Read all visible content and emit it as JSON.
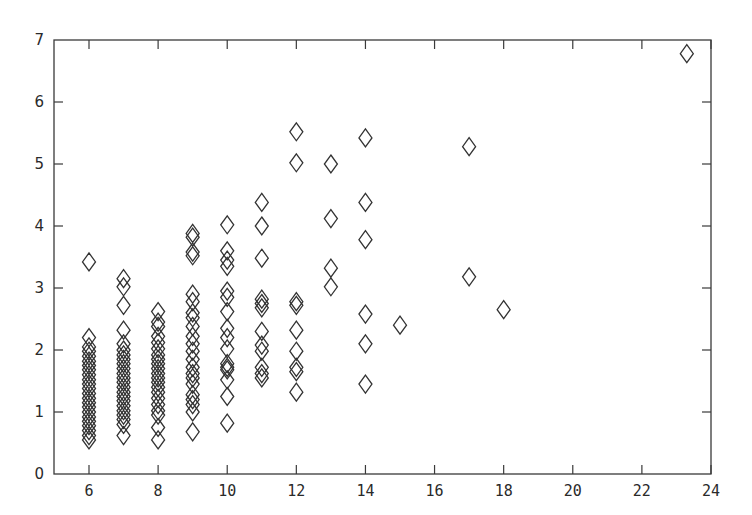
{
  "chart_data": {
    "type": "scatter",
    "title": "",
    "xlabel": "",
    "ylabel": "",
    "xlim": [
      5,
      24
    ],
    "ylim": [
      0,
      7
    ],
    "grid": false,
    "legend": null,
    "marker": "diamond-open",
    "x_ticks": [
      6,
      8,
      10,
      12,
      14,
      16,
      18,
      20,
      22,
      24
    ],
    "y_ticks": [
      0,
      1,
      2,
      3,
      4,
      5,
      6,
      7
    ],
    "series": [
      {
        "name": "points",
        "points": [
          [
            6,
            3.42
          ],
          [
            6,
            2.2
          ],
          [
            6,
            2.05
          ],
          [
            6,
            1.98
          ],
          [
            6,
            1.9
          ],
          [
            6,
            1.82
          ],
          [
            6,
            1.75
          ],
          [
            6,
            1.68
          ],
          [
            6,
            1.6
          ],
          [
            6,
            1.52
          ],
          [
            6,
            1.45
          ],
          [
            6,
            1.38
          ],
          [
            6,
            1.3
          ],
          [
            6,
            1.22
          ],
          [
            6,
            1.15
          ],
          [
            6,
            1.08
          ],
          [
            6,
            1.0
          ],
          [
            6,
            0.92
          ],
          [
            6,
            0.85
          ],
          [
            6,
            0.78
          ],
          [
            6,
            0.7
          ],
          [
            6,
            0.62
          ],
          [
            6,
            0.55
          ],
          [
            7,
            3.15
          ],
          [
            7,
            3.02
          ],
          [
            7,
            2.72
          ],
          [
            7,
            2.32
          ],
          [
            7,
            2.1
          ],
          [
            7,
            2.0
          ],
          [
            7,
            1.92
          ],
          [
            7,
            1.85
          ],
          [
            7,
            1.78
          ],
          [
            7,
            1.7
          ],
          [
            7,
            1.62
          ],
          [
            7,
            1.55
          ],
          [
            7,
            1.48
          ],
          [
            7,
            1.4
          ],
          [
            7,
            1.32
          ],
          [
            7,
            1.25
          ],
          [
            7,
            1.18
          ],
          [
            7,
            1.1
          ],
          [
            7,
            1.02
          ],
          [
            7,
            0.95
          ],
          [
            7,
            0.88
          ],
          [
            7,
            0.8
          ],
          [
            7,
            0.62
          ],
          [
            8,
            2.62
          ],
          [
            8,
            2.45
          ],
          [
            8,
            2.38
          ],
          [
            8,
            2.22
          ],
          [
            8,
            2.12
          ],
          [
            8,
            2.02
          ],
          [
            8,
            1.92
          ],
          [
            8,
            1.85
          ],
          [
            8,
            1.78
          ],
          [
            8,
            1.7
          ],
          [
            8,
            1.62
          ],
          [
            8,
            1.55
          ],
          [
            8,
            1.48
          ],
          [
            8,
            1.4
          ],
          [
            8,
            1.32
          ],
          [
            8,
            1.22
          ],
          [
            8,
            1.12
          ],
          [
            8,
            1.02
          ],
          [
            8,
            0.95
          ],
          [
            8,
            0.75
          ],
          [
            8,
            0.55
          ],
          [
            9,
            3.88
          ],
          [
            9,
            3.82
          ],
          [
            9,
            3.58
          ],
          [
            9,
            3.52
          ],
          [
            9,
            2.9
          ],
          [
            9,
            2.78
          ],
          [
            9,
            2.6
          ],
          [
            9,
            2.52
          ],
          [
            9,
            2.38
          ],
          [
            9,
            2.22
          ],
          [
            9,
            2.1
          ],
          [
            9,
            1.98
          ],
          [
            9,
            1.85
          ],
          [
            9,
            1.72
          ],
          [
            9,
            1.62
          ],
          [
            9,
            1.55
          ],
          [
            9,
            1.45
          ],
          [
            9,
            1.28
          ],
          [
            9,
            1.2
          ],
          [
            9,
            1.12
          ],
          [
            9,
            1.0
          ],
          [
            9,
            0.68
          ],
          [
            10,
            4.02
          ],
          [
            10,
            3.6
          ],
          [
            10,
            3.45
          ],
          [
            10,
            3.35
          ],
          [
            10,
            2.95
          ],
          [
            10,
            2.85
          ],
          [
            10,
            2.62
          ],
          [
            10,
            2.35
          ],
          [
            10,
            2.2
          ],
          [
            10,
            2.02
          ],
          [
            10,
            1.78
          ],
          [
            10,
            1.72
          ],
          [
            10,
            1.68
          ],
          [
            10,
            1.52
          ],
          [
            10,
            1.25
          ],
          [
            10,
            0.82
          ],
          [
            11,
            4.38
          ],
          [
            11,
            4.0
          ],
          [
            11,
            3.48
          ],
          [
            11,
            2.82
          ],
          [
            11,
            2.75
          ],
          [
            11,
            2.68
          ],
          [
            11,
            2.3
          ],
          [
            11,
            2.08
          ],
          [
            11,
            1.98
          ],
          [
            11,
            1.72
          ],
          [
            11,
            1.62
          ],
          [
            11,
            1.55
          ],
          [
            12,
            5.52
          ],
          [
            12,
            5.02
          ],
          [
            12,
            2.78
          ],
          [
            12,
            2.72
          ],
          [
            12,
            2.32
          ],
          [
            12,
            1.98
          ],
          [
            12,
            1.72
          ],
          [
            12,
            1.65
          ],
          [
            12,
            1.32
          ],
          [
            13,
            5.0
          ],
          [
            13,
            4.12
          ],
          [
            13,
            3.32
          ],
          [
            13,
            3.02
          ],
          [
            14,
            5.42
          ],
          [
            14,
            4.38
          ],
          [
            14,
            3.78
          ],
          [
            14,
            2.58
          ],
          [
            14,
            2.1
          ],
          [
            14,
            1.45
          ],
          [
            15,
            2.4
          ],
          [
            17,
            5.28
          ],
          [
            17,
            3.18
          ],
          [
            18,
            2.65
          ],
          [
            23.3,
            6.78
          ]
        ]
      }
    ]
  }
}
